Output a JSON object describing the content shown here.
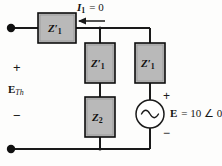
{
  "figure": {
    "type": "circuit-diagram",
    "background_color": "#fdfdfc",
    "wire_color": "#1a1a1a",
    "box_fill": "#b9b9b9",
    "box_stroke": "#0d0d0d"
  },
  "labels": {
    "current": {
      "symbol": "I",
      "subscript": "1",
      "equals": "= 0",
      "full": "I1 = 0"
    },
    "thevenin_voltage": {
      "plus": "+",
      "symbol": "E",
      "subscript": "Th",
      "minus": "−"
    },
    "source": {
      "plus": "+",
      "minus": "−",
      "symbol": "E",
      "value": "= 10 ∠ 0°",
      "full": "E = 10 ∠ 0°"
    }
  },
  "components": [
    {
      "id": "z1-prime-series",
      "symbol": "Z",
      "prime": "′",
      "subscript": "1",
      "orientation": "horizontal",
      "position": "top-left-series"
    },
    {
      "id": "z1-prime-middle",
      "symbol": "Z",
      "prime": "′",
      "subscript": "1",
      "orientation": "vertical",
      "position": "middle-branch-upper"
    },
    {
      "id": "z1-prime-right",
      "symbol": "Z",
      "prime": "′",
      "subscript": "1",
      "orientation": "vertical",
      "position": "right-branch-upper"
    },
    {
      "id": "z2",
      "symbol": "Z",
      "prime": "",
      "subscript": "2",
      "orientation": "vertical",
      "position": "middle-branch-lower"
    }
  ],
  "source_element": {
    "kind": "ac-voltage-source",
    "glyph": "sine-wave"
  },
  "terminals": [
    {
      "id": "terminal-top",
      "style": "filled-dot"
    },
    {
      "id": "terminal-bottom",
      "style": "filled-dot"
    }
  ]
}
